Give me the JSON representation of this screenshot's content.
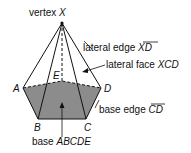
{
  "diagram": {
    "colors": {
      "base_fill": "#8c8c8c",
      "stroke": "#111111",
      "background": "#ffffff"
    },
    "points": {
      "X": {
        "label": "X",
        "x": 62,
        "y": 23
      },
      "A": {
        "label": "A",
        "x": 23,
        "y": 88
      },
      "B": {
        "label": "B",
        "x": 38,
        "y": 119
      },
      "C": {
        "label": "C",
        "x": 86,
        "y": 119
      },
      "D": {
        "label": "D",
        "x": 101,
        "y": 88
      },
      "E": {
        "label": "E",
        "x": 62,
        "y": 81
      }
    },
    "annotations": {
      "vertex": {
        "prefix": "vertex ",
        "name": "X"
      },
      "lateral_edge": {
        "prefix": "lateral edge ",
        "name": "XD"
      },
      "lateral_face": {
        "prefix": "lateral face ",
        "name": "XCD"
      },
      "base_edge": {
        "prefix": "base edge ",
        "name": "CD"
      },
      "base": {
        "prefix": "base ",
        "name": "ABCDE"
      }
    }
  }
}
